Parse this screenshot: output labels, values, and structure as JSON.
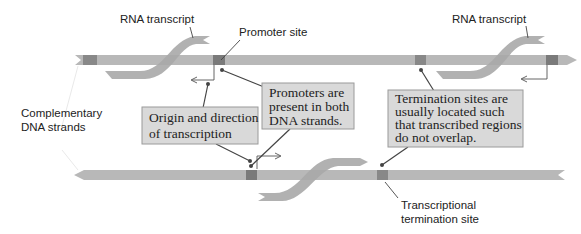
{
  "labels": {
    "rna_transcript_left": "RNA transcript",
    "rna_transcript_right": "RNA transcript",
    "promoter_site": "Promoter site",
    "complementary_line1": "Complementary",
    "complementary_line2": "DNA strands",
    "transcriptional_line1": "Transcriptional",
    "transcriptional_line2": "termination site"
  },
  "callouts": {
    "origin": {
      "line1": "Origin and direction",
      "line2": "of transcription"
    },
    "promoters": {
      "line1": "Promoters are",
      "line2": "present in both",
      "line3": "DNA strands."
    },
    "termination": {
      "line1": "Termination sites are",
      "line2": "usually located such",
      "line3": "that transcribed regions",
      "line4": "do not overlap."
    }
  },
  "colors": {
    "strand": "#b8b8b8",
    "site": "#858585",
    "transcript": "#a9a9a9",
    "box_fill": "#d9d9d9",
    "box_border": "#9a9a9a",
    "leader": "#444444"
  }
}
